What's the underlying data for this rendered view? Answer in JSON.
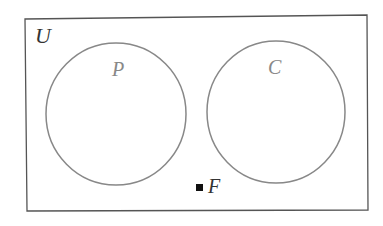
{
  "diagram": {
    "type": "venn",
    "universe": {
      "label": "U"
    },
    "sets": [
      {
        "label": "P"
      },
      {
        "label": "C"
      }
    ],
    "points": [
      {
        "label": "F"
      }
    ],
    "colors": {
      "border": "#555555",
      "circle": "#888888",
      "set_label": "#888888",
      "text": "#333333",
      "point": "#111111"
    }
  }
}
